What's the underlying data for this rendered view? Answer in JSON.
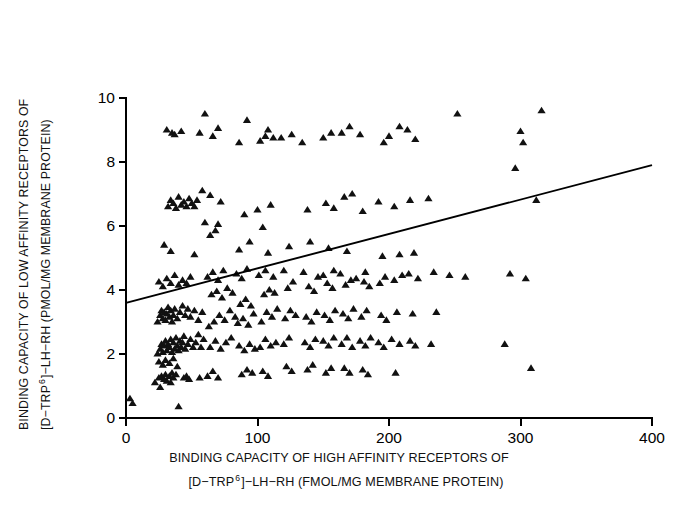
{
  "chart_data": {
    "type": "scatter",
    "title": "",
    "xlabel": "BINDING CAPACITY OF HIGH AFFINITY RECEPTORS OF [D-TRP 6]-LH-RH (FMOL/MG MEMBRANE PROTEIN)",
    "ylabel": "BINDING CAPACITY OF LOW AFFINITY RECEPTORS OF [D-TRP 6]-LH-RH (PMOL/MG MEMBRANE PROTEIN)",
    "xlim": [
      0,
      400
    ],
    "ylim": [
      0,
      10
    ],
    "xticks": [
      0,
      100,
      200,
      300,
      400
    ],
    "yticks": [
      0,
      2,
      4,
      6,
      8,
      10
    ],
    "grid": false,
    "legend": false,
    "marker": "triangle-up",
    "marker_color": "#111111",
    "trendline": {
      "label": "regression line",
      "x": [
        0,
        400
      ],
      "y": [
        3.6,
        7.9
      ],
      "intercept": 3.6,
      "slope": 0.01075,
      "color": "#000000"
    },
    "points": [
      [
        3,
        0.6
      ],
      [
        5,
        0.45
      ],
      [
        22,
        1.1
      ],
      [
        25,
        1.25
      ],
      [
        27,
        1.3
      ],
      [
        29,
        1.2
      ],
      [
        30,
        1.35
      ],
      [
        31,
        1.15
      ],
      [
        33,
        1.3
      ],
      [
        35,
        1.4
      ],
      [
        36,
        1.25
      ],
      [
        38,
        1.35
      ],
      [
        26,
        0.95
      ],
      [
        34,
        1.1
      ],
      [
        40,
        0.35
      ],
      [
        44,
        1.25
      ],
      [
        46,
        1.3
      ],
      [
        48,
        1.2
      ],
      [
        56,
        1.25
      ],
      [
        24,
        2.0
      ],
      [
        26,
        2.15
      ],
      [
        27,
        2.3
      ],
      [
        28,
        2.05
      ],
      [
        29,
        2.25
      ],
      [
        30,
        2.4
      ],
      [
        31,
        2.1
      ],
      [
        32,
        2.3
      ],
      [
        33,
        2.2
      ],
      [
        34,
        2.45
      ],
      [
        35,
        2.05
      ],
      [
        36,
        2.35
      ],
      [
        37,
        2.15
      ],
      [
        38,
        2.5
      ],
      [
        39,
        2.25
      ],
      [
        40,
        2.1
      ],
      [
        41,
        2.4
      ],
      [
        42,
        2.2
      ],
      [
        43,
        2.35
      ],
      [
        44,
        2.55
      ],
      [
        45,
        2.15
      ],
      [
        47,
        2.3
      ],
      [
        49,
        2.45
      ],
      [
        51,
        2.2
      ],
      [
        53,
        2.35
      ],
      [
        55,
        2.6
      ],
      [
        57,
        2.2
      ],
      [
        59,
        2.45
      ],
      [
        25,
        1.75
      ],
      [
        28,
        1.65
      ],
      [
        30,
        1.8
      ],
      [
        33,
        1.7
      ],
      [
        36,
        1.85
      ],
      [
        39,
        1.6
      ],
      [
        24,
        3.0
      ],
      [
        26,
        3.2
      ],
      [
        27,
        3.35
      ],
      [
        28,
        3.1
      ],
      [
        29,
        3.3
      ],
      [
        30,
        3.05
      ],
      [
        31,
        3.25
      ],
      [
        32,
        3.45
      ],
      [
        33,
        3.15
      ],
      [
        34,
        3.35
      ],
      [
        35,
        3.0
      ],
      [
        36,
        3.2
      ],
      [
        37,
        3.4
      ],
      [
        39,
        3.1
      ],
      [
        41,
        3.3
      ],
      [
        43,
        3.5
      ],
      [
        45,
        3.2
      ],
      [
        47,
        3.4
      ],
      [
        49,
        3.15
      ],
      [
        52,
        3.35
      ],
      [
        55,
        3.05
      ],
      [
        58,
        3.3
      ],
      [
        25,
        4.25
      ],
      [
        28,
        4.1
      ],
      [
        31,
        4.35
      ],
      [
        34,
        4.2
      ],
      [
        37,
        4.45
      ],
      [
        40,
        4.15
      ],
      [
        43,
        4.3
      ],
      [
        46,
        4.2
      ],
      [
        49,
        4.4
      ],
      [
        29,
        5.4
      ],
      [
        34,
        5.2
      ],
      [
        52,
        5.1
      ],
      [
        32,
        6.6
      ],
      [
        34,
        6.8
      ],
      [
        36,
        6.7
      ],
      [
        38,
        6.55
      ],
      [
        40,
        6.9
      ],
      [
        42,
        6.65
      ],
      [
        44,
        6.75
      ],
      [
        46,
        6.6
      ],
      [
        48,
        6.85
      ],
      [
        50,
        6.7
      ],
      [
        52,
        6.6
      ],
      [
        54,
        6.8
      ],
      [
        31,
        9.0
      ],
      [
        35,
        8.9
      ],
      [
        37,
        8.85
      ],
      [
        42,
        8.95
      ],
      [
        62,
        1.3
      ],
      [
        66,
        1.45
      ],
      [
        70,
        1.25
      ],
      [
        64,
        2.2
      ],
      [
        68,
        2.4
      ],
      [
        72,
        2.15
      ],
      [
        76,
        2.35
      ],
      [
        80,
        2.5
      ],
      [
        63,
        2.85
      ],
      [
        67,
        3.0
      ],
      [
        71,
        3.2
      ],
      [
        75,
        3.05
      ],
      [
        79,
        3.35
      ],
      [
        83,
        3.15
      ],
      [
        65,
        3.85
      ],
      [
        69,
        3.95
      ],
      [
        73,
        3.75
      ],
      [
        77,
        4.05
      ],
      [
        81,
        3.9
      ],
      [
        62,
        4.4
      ],
      [
        66,
        4.55
      ],
      [
        70,
        4.3
      ],
      [
        74,
        4.6
      ],
      [
        64,
        5.7
      ],
      [
        68,
        5.85
      ],
      [
        60,
        6.1
      ],
      [
        70,
        6.05
      ],
      [
        58,
        7.1
      ],
      [
        64,
        6.95
      ],
      [
        72,
        6.75
      ],
      [
        56,
        8.9
      ],
      [
        60,
        9.5
      ],
      [
        66,
        8.8
      ],
      [
        70,
        9.05
      ],
      [
        88,
        1.35
      ],
      [
        92,
        1.5
      ],
      [
        96,
        1.4
      ],
      [
        86,
        2.25
      ],
      [
        90,
        2.1
      ],
      [
        94,
        2.3
      ],
      [
        98,
        2.15
      ],
      [
        85,
        2.95
      ],
      [
        89,
        3.1
      ],
      [
        93,
        2.9
      ],
      [
        97,
        3.25
      ],
      [
        87,
        3.55
      ],
      [
        91,
        3.7
      ],
      [
        95,
        3.5
      ],
      [
        84,
        4.5
      ],
      [
        88,
        4.35
      ],
      [
        92,
        4.65
      ],
      [
        86,
        5.25
      ],
      [
        94,
        5.5
      ],
      [
        90,
        6.35
      ],
      [
        86,
        8.6
      ],
      [
        92,
        9.3
      ],
      [
        104,
        1.45
      ],
      [
        108,
        1.3
      ],
      [
        102,
        2.2
      ],
      [
        106,
        2.45
      ],
      [
        110,
        2.25
      ],
      [
        114,
        2.35
      ],
      [
        103,
        3.0
      ],
      [
        107,
        3.3
      ],
      [
        111,
        3.15
      ],
      [
        115,
        3.4
      ],
      [
        105,
        3.85
      ],
      [
        109,
        4.0
      ],
      [
        113,
        3.9
      ],
      [
        101,
        4.45
      ],
      [
        106,
        4.6
      ],
      [
        112,
        4.4
      ],
      [
        108,
        5.15
      ],
      [
        104,
        5.95
      ],
      [
        100,
        6.5
      ],
      [
        110,
        6.65
      ],
      [
        102,
        8.65
      ],
      [
        106,
        8.8
      ],
      [
        108,
        9.0
      ],
      [
        112,
        8.75
      ],
      [
        122,
        1.6
      ],
      [
        126,
        1.45
      ],
      [
        120,
        2.3
      ],
      [
        124,
        2.5
      ],
      [
        121,
        3.1
      ],
      [
        125,
        3.35
      ],
      [
        129,
        3.2
      ],
      [
        123,
        4.05
      ],
      [
        127,
        4.25
      ],
      [
        120,
        4.6
      ],
      [
        124,
        5.35
      ],
      [
        118,
        8.75
      ],
      [
        126,
        8.85
      ],
      [
        138,
        1.5
      ],
      [
        142,
        1.65
      ],
      [
        136,
        2.35
      ],
      [
        140,
        2.2
      ],
      [
        144,
        2.45
      ],
      [
        137,
        3.15
      ],
      [
        141,
        3.0
      ],
      [
        145,
        3.3
      ],
      [
        139,
        4.1
      ],
      [
        143,
        3.95
      ],
      [
        135,
        4.55
      ],
      [
        146,
        4.4
      ],
      [
        140,
        5.5
      ],
      [
        138,
        6.5
      ],
      [
        134,
        8.6
      ],
      [
        152,
        1.4
      ],
      [
        156,
        1.55
      ],
      [
        150,
        2.4
      ],
      [
        154,
        2.25
      ],
      [
        158,
        2.5
      ],
      [
        151,
        3.2
      ],
      [
        155,
        3.05
      ],
      [
        159,
        3.35
      ],
      [
        153,
        4.2
      ],
      [
        157,
        4.05
      ],
      [
        150,
        4.45
      ],
      [
        158,
        4.6
      ],
      [
        154,
        5.3
      ],
      [
        152,
        6.7
      ],
      [
        158,
        6.55
      ],
      [
        150,
        8.75
      ],
      [
        156,
        8.9
      ],
      [
        166,
        1.55
      ],
      [
        170,
        1.4
      ],
      [
        164,
        2.3
      ],
      [
        168,
        2.5
      ],
      [
        172,
        2.2
      ],
      [
        165,
        3.25
      ],
      [
        169,
        3.1
      ],
      [
        173,
        3.4
      ],
      [
        167,
        4.15
      ],
      [
        171,
        4.3
      ],
      [
        163,
        4.5
      ],
      [
        175,
        4.35
      ],
      [
        168,
        5.2
      ],
      [
        166,
        6.9
      ],
      [
        172,
        7.0
      ],
      [
        164,
        8.9
      ],
      [
        170,
        9.1
      ],
      [
        180,
        1.5
      ],
      [
        184,
        1.35
      ],
      [
        178,
        2.4
      ],
      [
        182,
        2.25
      ],
      [
        186,
        2.5
      ],
      [
        179,
        3.15
      ],
      [
        183,
        3.35
      ],
      [
        181,
        4.25
      ],
      [
        185,
        4.1
      ],
      [
        182,
        4.55
      ],
      [
        180,
        6.45
      ],
      [
        178,
        8.85
      ],
      [
        192,
        2.35
      ],
      [
        196,
        2.2
      ],
      [
        194,
        3.2
      ],
      [
        198,
        3.05
      ],
      [
        193,
        4.2
      ],
      [
        197,
        4.4
      ],
      [
        195,
        5.05
      ],
      [
        192,
        6.75
      ],
      [
        196,
        8.6
      ],
      [
        205,
        1.4
      ],
      [
        202,
        2.45
      ],
      [
        208,
        2.3
      ],
      [
        206,
        3.3
      ],
      [
        204,
        4.3
      ],
      [
        210,
        4.45
      ],
      [
        208,
        5.1
      ],
      [
        204,
        6.6
      ],
      [
        200,
        8.8
      ],
      [
        208,
        9.1
      ],
      [
        216,
        2.4
      ],
      [
        220,
        2.25
      ],
      [
        218,
        3.25
      ],
      [
        215,
        4.5
      ],
      [
        222,
        4.35
      ],
      [
        219,
        5.15
      ],
      [
        216,
        6.8
      ],
      [
        214,
        9.0
      ],
      [
        220,
        8.7
      ],
      [
        232,
        2.3
      ],
      [
        236,
        3.3
      ],
      [
        234,
        4.55
      ],
      [
        230,
        6.85
      ],
      [
        246,
        4.45
      ],
      [
        252,
        9.5
      ],
      [
        258,
        4.4
      ],
      [
        288,
        2.3
      ],
      [
        292,
        4.5
      ],
      [
        296,
        7.8
      ],
      [
        304,
        4.35
      ],
      [
        308,
        1.55
      ],
      [
        300,
        8.95
      ],
      [
        302,
        8.6
      ],
      [
        312,
        6.8
      ],
      [
        316,
        9.6
      ]
    ]
  },
  "axis": {
    "x_tick_labels": [
      "0",
      "100",
      "200",
      "300",
      "400"
    ],
    "y_tick_labels": [
      "0",
      "2",
      "4",
      "6",
      "8",
      "10"
    ]
  },
  "labels": {
    "y_line1_a": "BINDING CAPACITY OF LOW AFFINITY RECEPTORS OF",
    "y_line2_a": "[D−TRP",
    "y_line2_sup": "6",
    "y_line2_b": "]−LH−RH (PMOL/MG MEMBRANE PROTEIN)",
    "x_line1": "BINDING CAPACITY OF HIGH AFFINITY RECEPTORS OF",
    "x_line2_a": "[D−TRP",
    "x_line2_sup": "6",
    "x_line2_b": "]−LH−RH (FMOL/MG MEMBRANE PROTEIN)"
  }
}
